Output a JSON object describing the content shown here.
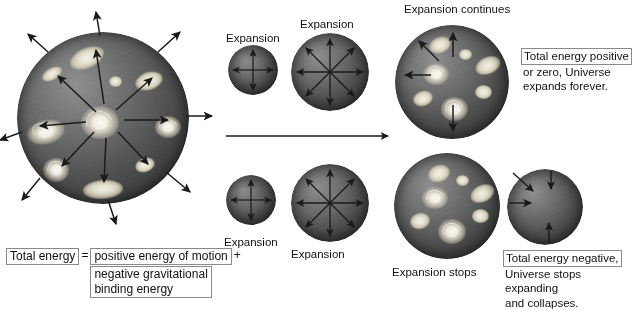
{
  "figure": {
    "title_implicit": "Expansion of the Universe and total energy",
    "timeline_arrow": "time-arrow-right"
  },
  "captions": {
    "top_row": [
      {
        "label": "Expansion",
        "x": 226,
        "y": 32
      },
      {
        "label": "Expansion",
        "x": 300,
        "y": 18
      },
      {
        "label": "Expansion continues",
        "x": 404,
        "y": 3
      }
    ],
    "bottom_row": [
      {
        "label": "Expansion",
        "x": 224,
        "y": 236
      },
      {
        "label": "Expansion",
        "x": 291,
        "y": 248
      },
      {
        "label": "Expansion stops",
        "x": 392,
        "y": 268
      }
    ]
  },
  "boxes": {
    "top_right": {
      "highlight": "Total energy positive",
      "lines": [
        "or zero, Universe",
        "expands forever."
      ]
    },
    "bottom_right": {
      "highlight": "Total energy negative,",
      "lines": [
        "Universe stops expanding",
        "and collapses."
      ]
    }
  },
  "equation": {
    "left": "Total energy",
    "equals": "=",
    "term1": "positive energy of motion",
    "plus": "+",
    "term2_line1": "negative gravitational",
    "term2_line2": "binding energy"
  },
  "colors": {
    "sphere_light": "#8f8f8f",
    "sphere_dark": "#2b2b2b",
    "galaxy": "#efece0",
    "arrow": "#1a1a1a",
    "box_border": "#8a8a8a",
    "text": "#111111",
    "background": "#ffffff"
  },
  "spheres": [
    {
      "name": "universe-large-left",
      "cx": 103,
      "cy": 118,
      "r": 86,
      "arrows": "outward-external"
    },
    {
      "name": "universe-top-small",
      "cx": 253,
      "cy": 70,
      "r": 25,
      "arrows": "outward-internal"
    },
    {
      "name": "universe-top-medium",
      "cx": 330,
      "cy": 72,
      "r": 39,
      "arrows": "outward-internal"
    },
    {
      "name": "universe-top-large",
      "cx": 452,
      "cy": 82,
      "r": 57,
      "arrows": "outward-internal"
    },
    {
      "name": "universe-bottom-small",
      "cx": 251,
      "cy": 200,
      "r": 25,
      "arrows": "outward-internal"
    },
    {
      "name": "universe-bottom-medium",
      "cx": 330,
      "cy": 203,
      "r": 39,
      "arrows": "outward-internal"
    },
    {
      "name": "universe-bottom-large",
      "cx": 447,
      "cy": 206,
      "r": 53,
      "arrows": "none"
    },
    {
      "name": "universe-bottom-collapsing",
      "cx": 545,
      "cy": 207,
      "r": 38,
      "arrows": "inward-internal"
    }
  ]
}
